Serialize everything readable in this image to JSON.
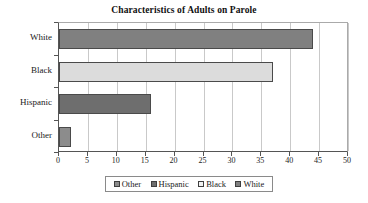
{
  "chart_data": {
    "type": "bar",
    "orientation": "horizontal",
    "title": "Characteristics of Adults on Parole",
    "xlabel": "",
    "ylabel": "",
    "categories": [
      "White",
      "Black",
      "Hispanic",
      "Other"
    ],
    "values": [
      44,
      37,
      16,
      2
    ],
    "xlim": [
      0,
      50
    ],
    "xticks": [
      0,
      5,
      10,
      15,
      20,
      25,
      30,
      35,
      40,
      45,
      50
    ],
    "xtick_labels": [
      "0",
      "5",
      "10",
      "15",
      "20",
      "25",
      "30",
      "35",
      "40",
      "45",
      "50"
    ],
    "grid": true,
    "grid_axis": "x",
    "legend_position": "bottom",
    "legend": [
      {
        "label": "Other",
        "color": "#8c8c8c"
      },
      {
        "label": "Hispanic",
        "color": "#6e6e6e"
      },
      {
        "label": "Black",
        "color": "#f2f2f2"
      },
      {
        "label": "White",
        "color": "#808080"
      }
    ],
    "series": [
      {
        "name": "White",
        "value": 44,
        "color": "#808080"
      },
      {
        "name": "Black",
        "value": 37,
        "color": "#dcdcdc"
      },
      {
        "name": "Hispanic",
        "value": 16,
        "color": "#6e6e6e"
      },
      {
        "name": "Other",
        "value": 2,
        "color": "#8c8c8c"
      }
    ],
    "colors": {
      "axis": "#555555",
      "grid": "#c9c9c9",
      "bar_border": "#4a4a4a",
      "text": "#1a1a1a",
      "background": "#ffffff"
    }
  }
}
